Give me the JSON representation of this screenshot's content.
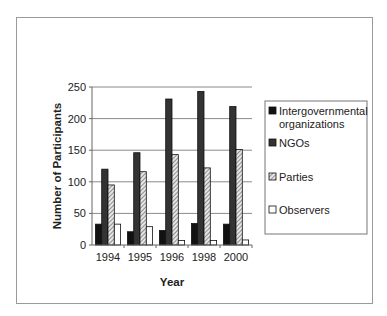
{
  "chart_data": {
    "type": "bar",
    "title": "",
    "xlabel": "Year",
    "ylabel": "Number of Participants",
    "categories": [
      "1994",
      "1995",
      "1996",
      "1998",
      "2000"
    ],
    "ylim": [
      0,
      250
    ],
    "yticks": [
      0,
      50,
      100,
      150,
      200,
      250
    ],
    "grid": true,
    "legend_position": "right",
    "series": [
      {
        "name": "Intergovernmental organizations",
        "legend_lines": [
          "Intergovernmental",
          "organizations"
        ],
        "values": [
          33,
          21,
          23,
          34,
          33
        ],
        "fill": "#111111",
        "pattern": "solid"
      },
      {
        "name": "NGOs",
        "legend_lines": [
          "NGOs"
        ],
        "values": [
          120,
          146,
          231,
          243,
          219
        ],
        "fill": "#333333",
        "pattern": "solid"
      },
      {
        "name": "Parties",
        "legend_lines": [
          "Parties"
        ],
        "values": [
          95,
          116,
          143,
          122,
          151
        ],
        "fill": "#bbbbbb",
        "pattern": "hatch"
      },
      {
        "name": "Observers",
        "legend_lines": [
          "Observers"
        ],
        "values": [
          33,
          29,
          7,
          7,
          8
        ],
        "fill": "#ffffff",
        "pattern": "outline"
      }
    ]
  }
}
